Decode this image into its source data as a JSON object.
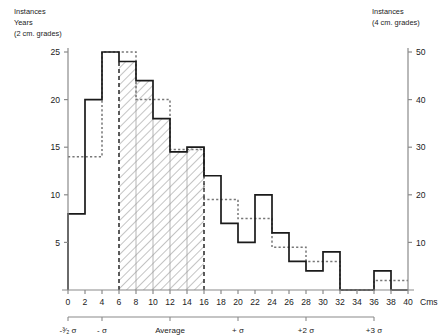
{
  "chart_data": {
    "type": "bar",
    "title": "",
    "xlabel": "Cms",
    "ylabel_left": "Instances Years (2 cm. grades)",
    "ylabel_right": "Instances (4 cm. grades)",
    "xlim": [
      0,
      40
    ],
    "ylim_left": [
      0,
      25
    ],
    "ylim_right": [
      0,
      50
    ],
    "grid": false,
    "legend": "none",
    "bin_width": 2,
    "categories": [
      "0-2",
      "2-4",
      "4-6",
      "6-8",
      "8-10",
      "10-12",
      "12-14",
      "14-16",
      "16-18",
      "18-20",
      "20-22",
      "22-24",
      "24-26",
      "26-28",
      "28-30",
      "30-32",
      "32-34",
      "34-36",
      "36-38",
      "38-40"
    ],
    "series": [
      {
        "name": "Instances Years (2 cm. grades)",
        "axis": "left",
        "style": "solid-step",
        "values": [
          8,
          20,
          25,
          24,
          22,
          18,
          14.5,
          15,
          12,
          7,
          5,
          10,
          6,
          3,
          2,
          4,
          0,
          0,
          2,
          0
        ]
      },
      {
        "name": "Instances (4 cm. grades)",
        "axis": "right",
        "style": "dotted-step",
        "bin_width": 4,
        "categories_4cm": [
          "0-4",
          "4-8",
          "8-12",
          "12-16",
          "16-20",
          "20-24",
          "24-28",
          "28-32",
          "32-36",
          "36-40"
        ],
        "values_right_scale": [
          28,
          50,
          40,
          29.5,
          19,
          15,
          9,
          6,
          0,
          2
        ],
        "values_left_scale": [
          14,
          25,
          20,
          14.75,
          9.5,
          7.5,
          4.5,
          3,
          0,
          1
        ]
      }
    ],
    "shaded_region": {
      "from": 6,
      "to": 16,
      "label": "hatched"
    },
    "yticks_left": [
      5,
      10,
      15,
      20,
      25
    ],
    "yticks_right": [
      10,
      20,
      30,
      40,
      50
    ],
    "xticks": [
      0,
      2,
      4,
      6,
      8,
      10,
      12,
      14,
      16,
      18,
      20,
      22,
      24,
      26,
      28,
      30,
      32,
      34,
      36,
      38,
      40
    ],
    "sigma_axis": {
      "ticks": [
        {
          "label": "-³⁄₂ σ",
          "cm": 0
        },
        {
          "label": "- σ",
          "cm": 4
        },
        {
          "label": "Average",
          "cm": 12
        },
        {
          "label": "+ σ",
          "cm": 20
        },
        {
          "label": "+2 σ",
          "cm": 28
        },
        {
          "label": "+3 σ",
          "cm": 36
        }
      ]
    }
  },
  "labels": {
    "left_axis_line1": "Instances",
    "left_axis_line2": "Years",
    "left_axis_line3": "(2 cm. grades)",
    "right_axis_line1": "Instances",
    "right_axis_line2": "(4 cm. grades)",
    "x_unit": "Cms"
  },
  "colors": {
    "line": "#1a1a1a",
    "axis": "#8a8a8a",
    "hatch": "#b5b5b5",
    "dotted": "#777777",
    "background": "#ffffff"
  }
}
